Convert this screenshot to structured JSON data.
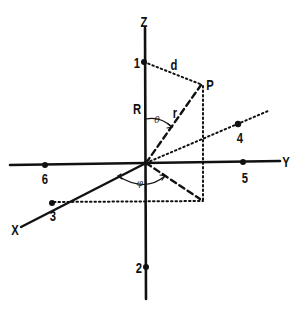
{
  "diagram": {
    "type": "3d-coordinate-axes",
    "axes": {
      "x": "X",
      "y": "Y",
      "z": "Z"
    },
    "point_labels": {
      "p1": "1",
      "p2": "2",
      "p3": "3",
      "p4": "4",
      "p5": "5",
      "p6": "6",
      "P": "P"
    },
    "segment_labels": {
      "d": "d",
      "R": "R",
      "r": "r"
    },
    "angle_labels": {
      "theta": "θ",
      "phi": "φ"
    },
    "colors": {
      "ink": "#111111",
      "background": "#ffffff"
    }
  }
}
